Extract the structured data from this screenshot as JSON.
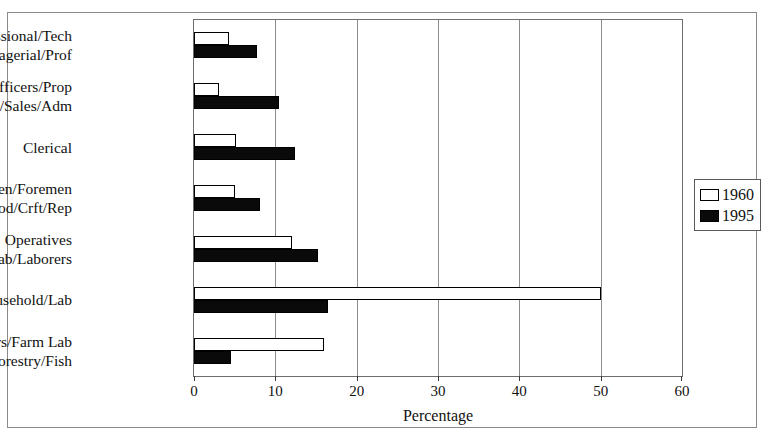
{
  "chart_data": {
    "type": "bar",
    "orientation": "horizontal",
    "title": "",
    "xlabel": "Percentage",
    "ylabel": "",
    "xlim": [
      0,
      60
    ],
    "xticks": [
      0,
      10,
      20,
      30,
      40,
      50,
      60
    ],
    "xtick_labels": [
      "0",
      "10",
      "20",
      "30",
      "40",
      "50",
      "60"
    ],
    "grid": true,
    "grid_axis": "x",
    "legend_position": "right",
    "categories": [
      "Professional/Tech\nManagerial/Prof",
      "Mgrs/Officers/Prop\nTech/Sales/Adm",
      "Clerical",
      "Craftsmen/Foremen\nPrec Prod/Crft/Rep",
      "Operatives\nOper/Fab/Laborers",
      "Private Household/Lab",
      "Farmers/Farm Lab\nFarm/Forestry/Fish"
    ],
    "category_lines": [
      [
        "Professional/Tech",
        "Managerial/Prof"
      ],
      [
        "Mgrs/Officers/Prop",
        "Tech/Sales/Adm"
      ],
      [
        "Clerical"
      ],
      [
        "Craftsmen/Foremen",
        "Prec Prod/Crft/Rep"
      ],
      [
        "Operatives",
        "Oper/Fab/Laborers"
      ],
      [
        "Private Household/Lab"
      ],
      [
        "Farmers/Farm Lab",
        "Farm/Forestry/Fish"
      ]
    ],
    "series": [
      {
        "name": "1960",
        "color": "#ffffff",
        "edge_color": "#000000",
        "values": [
          4.3,
          3.1,
          5.2,
          5.1,
          12.0,
          50.0,
          16.0
        ]
      },
      {
        "name": "1995",
        "color": "#0a0a0a",
        "edge_color": "#000000",
        "values": [
          7.7,
          10.4,
          12.4,
          8.1,
          15.2,
          16.5,
          4.5
        ]
      }
    ]
  },
  "legend": {
    "items": [
      {
        "label": "1960",
        "swatch": "white-square-icon"
      },
      {
        "label": "1995",
        "swatch": "black-square-icon"
      }
    ]
  },
  "axis": {
    "x_title": "Percentage"
  }
}
